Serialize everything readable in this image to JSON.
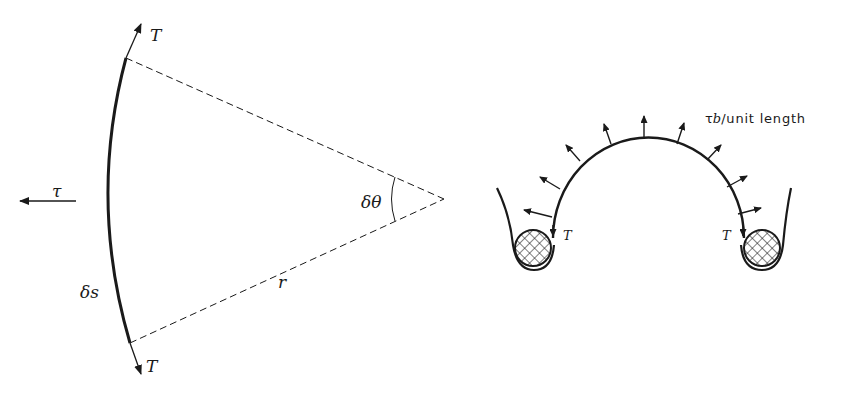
{
  "left_figure": {
    "labels": {
      "tension_top": "T",
      "tension_bottom": "T",
      "pressure": "τ",
      "arc_length": "δs",
      "radius": "r",
      "angle": "δθ"
    }
  },
  "right_figure": {
    "labels": {
      "load": "τb/unit length",
      "load_symbol": "τ",
      "load_b": "b",
      "load_rest": "/unit length",
      "tension_left": "T",
      "tension_right": "T"
    },
    "arrow_count": 11
  },
  "colors": {
    "ink": "#1a1a1a",
    "background": "#ffffff"
  }
}
